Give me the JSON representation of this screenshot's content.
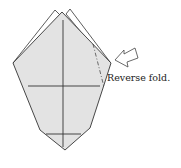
{
  "diagram": {
    "annotation": "Reverse fold.",
    "colors": {
      "paper_fill": "#e3e3e3",
      "outline": "#333333",
      "background": "#ffffff"
    },
    "icons": {
      "arrow": "hollow-push-arrow"
    }
  }
}
